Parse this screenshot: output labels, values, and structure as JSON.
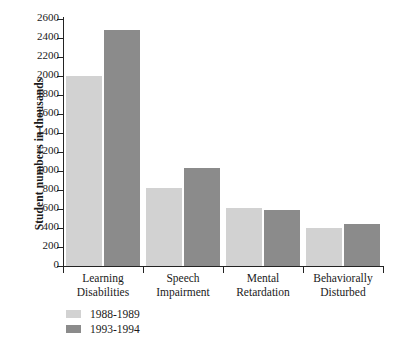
{
  "chart_data": {
    "type": "bar",
    "title": "",
    "xlabel": "",
    "ylabel": "Student numbers in thousands",
    "ylim": [
      0,
      2600
    ],
    "ytick_step": 200,
    "yticks": [
      0,
      200,
      400,
      600,
      800,
      1000,
      1200,
      1400,
      1600,
      1800,
      2000,
      2200,
      2400,
      2600
    ],
    "categories": [
      "Learning Disabilities",
      "Speech Impairment",
      "Mental Retardation",
      "Behaviorally Disturbed"
    ],
    "category_lines": [
      [
        "Learning",
        "Disabilities"
      ],
      [
        "Speech",
        "Impairment"
      ],
      [
        "Mental",
        "Retardation"
      ],
      [
        "Behaviorally",
        "Disturbed"
      ]
    ],
    "series": [
      {
        "name": "1988-1989",
        "color": "#d2d2d2",
        "values": [
          2000,
          820,
          610,
          400
        ]
      },
      {
        "name": "1993-1994",
        "color": "#8b8b8b",
        "values": [
          2480,
          1030,
          590,
          440
        ]
      }
    ],
    "grid": false,
    "legend_position": "bottom-left"
  },
  "legend": {
    "entries": [
      {
        "label": "1988-1989",
        "color": "#d2d2d2"
      },
      {
        "label": "1993-1994",
        "color": "#8b8b8b"
      }
    ]
  },
  "caption": {
    "text": ""
  },
  "colors": {
    "axis": "#232323",
    "text": "#1a1a1a",
    "series_1988": "#d2d2d2",
    "series_1993": "#8b8b8b",
    "background": "#ffffff"
  }
}
